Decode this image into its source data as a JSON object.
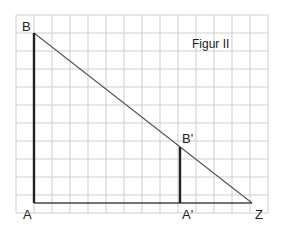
{
  "figure": {
    "title": "Figur II",
    "grid": {
      "x0": 16,
      "y0": 15,
      "cell": 18,
      "cols": 14,
      "rows": 11,
      "color": "#cfcfcf"
    },
    "points": {
      "A": {
        "label": "A",
        "x": 34,
        "y": 203
      },
      "B": {
        "label": "B",
        "x": 34,
        "y": 33
      },
      "Z": {
        "label": "Z",
        "x": 252,
        "y": 203
      },
      "A_prime": {
        "label": "A'",
        "x": 180,
        "y": 203
      },
      "B_prime": {
        "label": "B'",
        "x": 180,
        "y": 147
      }
    },
    "segments": [
      {
        "name": "AB",
        "from": "A",
        "to": "B",
        "weight": "thick"
      },
      {
        "name": "AZ",
        "from": "A",
        "to": "Z",
        "weight": "medium"
      },
      {
        "name": "BZ",
        "from": "B",
        "to": "Z",
        "weight": "thin"
      },
      {
        "name": "A'B'",
        "from": "A_prime",
        "to": "B_prime",
        "weight": "thick"
      }
    ],
    "colors": {
      "line": "#333333",
      "thin_line": "#555555"
    }
  }
}
